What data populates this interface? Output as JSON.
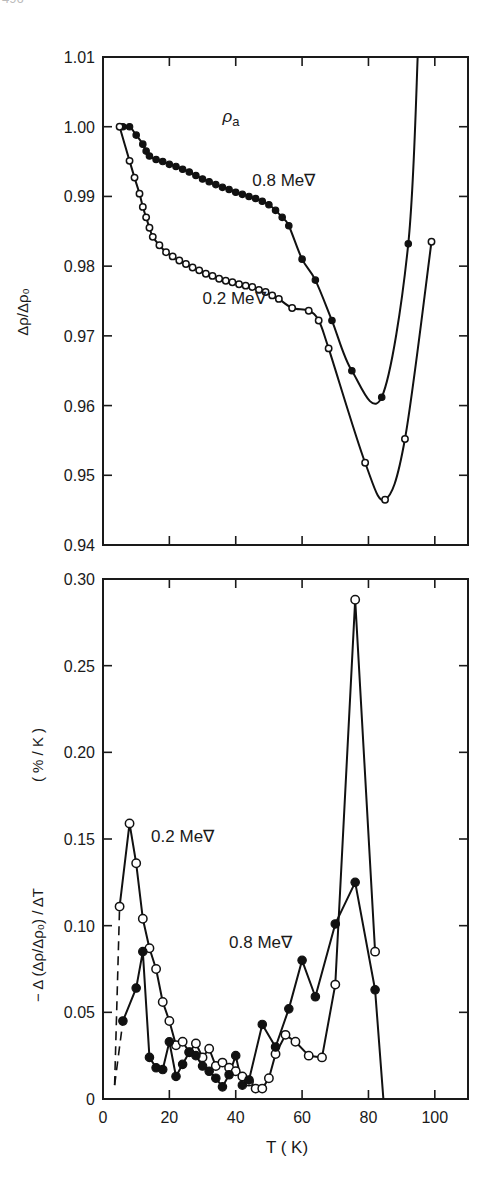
{
  "page_number_fragment": "496",
  "chart_data": [
    {
      "type": "line",
      "title": "",
      "annotation": "ρa",
      "xlabel": "",
      "ylabel": "Δρ/Δρ0",
      "xlim": [
        0,
        110
      ],
      "ylim": [
        0.94,
        1.01
      ],
      "x_ticks": [
        0,
        20,
        40,
        60,
        80,
        100
      ],
      "y_ticks": [
        "0.94",
        "0.95",
        "0.96",
        "0.97",
        "0.98",
        "0.99",
        "1.00",
        "1.01"
      ],
      "grid": false,
      "series": [
        {
          "name": "0.8 MeV",
          "marker": "filled-circle",
          "label_pos": [
            45,
            0.9915
          ],
          "x": [
            6,
            8,
            10,
            12,
            13,
            14,
            16,
            18,
            20,
            22,
            24,
            26,
            28,
            30,
            32,
            34,
            36,
            38,
            40,
            42,
            44,
            46,
            48,
            50,
            52,
            54,
            56,
            60,
            64,
            69,
            75,
            84,
            92
          ],
          "y": [
            1.0,
            1.0,
            0.9988,
            0.9975,
            0.9965,
            0.9958,
            0.9953,
            0.995,
            0.9946,
            0.9943,
            0.9939,
            0.9935,
            0.993,
            0.9925,
            0.9921,
            0.9917,
            0.9913,
            0.991,
            0.9906,
            0.9903,
            0.99,
            0.9897,
            0.9893,
            0.9888,
            0.988,
            0.987,
            0.9858,
            0.981,
            0.978,
            0.9722,
            0.965,
            0.9612,
            0.9832
          ],
          "curve_extends_to": [
            95,
            1.012
          ]
        },
        {
          "name": "0.2 MeV",
          "marker": "open-circle",
          "label_pos": [
            30,
            0.9745
          ],
          "x": [
            5,
            8,
            9.5,
            11,
            12,
            13,
            14,
            15,
            17,
            19,
            21,
            23,
            25,
            27,
            29,
            31,
            33,
            35,
            37,
            39,
            41,
            43,
            45,
            47,
            49,
            51,
            53,
            57,
            62,
            65,
            68,
            79,
            85,
            91,
            99
          ],
          "y": [
            1.0,
            0.9951,
            0.9927,
            0.9904,
            0.9885,
            0.987,
            0.9855,
            0.9842,
            0.983,
            0.982,
            0.9814,
            0.9808,
            0.9803,
            0.9798,
            0.9794,
            0.9789,
            0.9786,
            0.9782,
            0.9779,
            0.9777,
            0.9774,
            0.9772,
            0.977,
            0.9766,
            0.9763,
            0.9758,
            0.9753,
            0.974,
            0.9736,
            0.9722,
            0.9682,
            0.9518,
            0.9465,
            0.9552,
            0.9835
          ]
        }
      ]
    },
    {
      "type": "line",
      "title": "",
      "xlabel": "T ( K)",
      "ylabel": "− Δ (Δρ/Δρ0) / ΔT    (% / K)",
      "xlim": [
        0,
        110
      ],
      "ylim": [
        0,
        0.3
      ],
      "x_ticks": [
        "0",
        "20",
        "40",
        "60",
        "80",
        "100"
      ],
      "y_ticks": [
        "0",
        "0.05",
        "0.10",
        "0.15",
        "0.20",
        "0.25",
        "0.30"
      ],
      "grid": false,
      "dashed_extrapolation": {
        "x": [
          3.5,
          5.0
        ],
        "y": [
          0.008,
          0.111
        ]
      },
      "dashed_extrapolation_filled": {
        "x": [
          3.5,
          6.0
        ],
        "y": [
          0.008,
          0.045
        ]
      },
      "series": [
        {
          "name": "0.2 MeV",
          "marker": "open-circle",
          "label_pos": [
            14.5,
            0.148
          ],
          "x": [
            5,
            8,
            10,
            12,
            14,
            16,
            18,
            20,
            22,
            24,
            26,
            28,
            30,
            32,
            34,
            36,
            38,
            40,
            42,
            44,
            46,
            48,
            50,
            52,
            55,
            58,
            62,
            66,
            70,
            76,
            82
          ],
          "y": [
            0.111,
            0.159,
            0.136,
            0.104,
            0.087,
            0.075,
            0.056,
            0.045,
            0.031,
            0.033,
            0.027,
            0.032,
            0.024,
            0.029,
            0.019,
            0.021,
            0.018,
            0.016,
            0.013,
            0.01,
            0.006,
            0.006,
            0.012,
            0.026,
            0.037,
            0.033,
            0.025,
            0.024,
            0.066,
            0.288,
            0.085
          ]
        },
        {
          "name": "0.8 MeV",
          "marker": "filled-circle",
          "label_pos": [
            38,
            0.087
          ],
          "x": [
            6,
            10,
            12,
            14,
            16,
            18,
            20,
            22,
            24,
            26,
            28,
            30,
            32,
            34,
            36,
            38,
            40,
            42,
            44,
            48,
            52,
            56,
            60,
            64,
            70,
            76,
            82,
            84.5
          ],
          "y": [
            0.045,
            0.064,
            0.085,
            0.024,
            0.018,
            0.017,
            0.033,
            0.013,
            0.02,
            0.027,
            0.025,
            0.019,
            0.016,
            0.012,
            0.007,
            0.014,
            0.025,
            0.008,
            0.011,
            0.043,
            0.03,
            0.052,
            0.08,
            0.059,
            0.101,
            0.125,
            0.063,
            0.0
          ]
        }
      ]
    }
  ]
}
